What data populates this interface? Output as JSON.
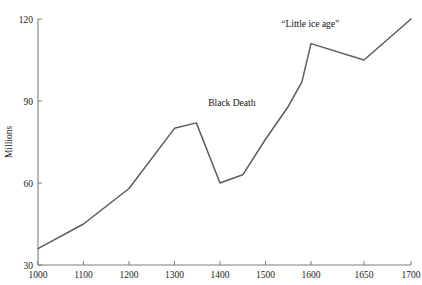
{
  "chart_data": {
    "type": "line",
    "title": "",
    "subtitle": "",
    "xlabel": "",
    "ylabel": "Millions",
    "xlim": [
      1000,
      1700
    ],
    "ylim": [
      30,
      120
    ],
    "grid": false,
    "legend": "none",
    "x_ticks": [
      1000,
      1100,
      1200,
      1300,
      1400,
      1500,
      1600,
      1650,
      1700
    ],
    "x_tick_labels": [
      "1000",
      "1100",
      "1200",
      "1300",
      "1400",
      "1500",
      "1600",
      "1650",
      "1700"
    ],
    "y_ticks": [
      30,
      60,
      90,
      120
    ],
    "y_tick_labels": [
      "30",
      "60",
      "90",
      "120"
    ],
    "series": [
      {
        "name": "Population",
        "color": "#5c5c5c",
        "x": [
          1000,
          1100,
          1200,
          1300,
          1348,
          1400,
          1450,
          1500,
          1550,
          1580,
          1600,
          1650,
          1700
        ],
        "values": [
          36,
          45,
          58,
          80,
          82,
          60,
          63,
          76,
          88,
          97,
          111,
          105,
          120
        ]
      }
    ],
    "annotations": [
      {
        "text": "Black Death",
        "x": 1360,
        "y": 86,
        "dx": 30,
        "dy": -6
      },
      {
        "text": "“Little ice age”",
        "x": 1605,
        "y": 114,
        "dx": -6,
        "dy": -8
      }
    ]
  },
  "axis": {
    "y_title": "Millions"
  }
}
